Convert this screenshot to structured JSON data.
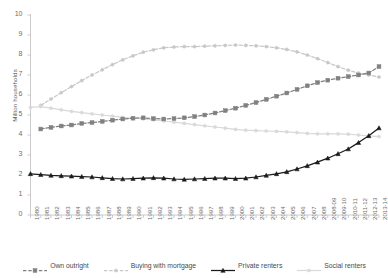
{
  "chart_data": {
    "type": "line",
    "title": "",
    "xlabel": "",
    "ylabel": "Million households",
    "ylim": [
      0,
      10
    ],
    "yticks": [
      0,
      1,
      2,
      3,
      4,
      5,
      6,
      7,
      8,
      9,
      10
    ],
    "grid": false,
    "legend_position": "bottom",
    "categories": [
      "1980",
      "1981",
      "1982",
      "1983",
      "1984",
      "1985",
      "1986",
      "1987",
      "1988",
      "1989",
      "1990",
      "1991",
      "1992",
      "1993",
      "1994",
      "1995",
      "1996",
      "1997",
      "1998",
      "1999",
      "2000",
      "2001",
      "2002",
      "2003",
      "2004",
      "2005",
      "2006",
      "2007",
      "2008",
      "2008-09",
      "2009-10",
      "2010-11",
      "2011-12",
      "2012-13",
      "2013-14"
    ],
    "series": [
      {
        "name": "Own outright",
        "color": "#808080",
        "marker": "square",
        "dash": "dashed",
        "values": [
          null,
          4.3,
          4.38,
          4.45,
          4.5,
          4.58,
          4.62,
          4.68,
          4.74,
          4.8,
          4.84,
          4.86,
          4.82,
          4.8,
          4.82,
          4.86,
          4.92,
          5.0,
          5.1,
          5.22,
          5.34,
          5.48,
          5.62,
          5.78,
          5.94,
          6.1,
          6.28,
          6.46,
          6.62,
          6.74,
          6.84,
          6.92,
          7.0,
          7.1,
          7.42
        ]
      },
      {
        "name": "Buying with mortgage",
        "color": "#c8c8c8",
        "marker": "circle",
        "dash": "dashed",
        "values": [
          null,
          5.48,
          5.8,
          6.12,
          6.42,
          6.72,
          7.0,
          7.26,
          7.52,
          7.76,
          7.96,
          8.14,
          8.26,
          8.36,
          8.4,
          8.42,
          8.42,
          8.44,
          8.46,
          8.48,
          8.5,
          8.48,
          8.46,
          8.42,
          8.36,
          8.28,
          8.16,
          8.0,
          7.82,
          7.62,
          7.42,
          7.24,
          7.1,
          7.0,
          6.9
        ]
      },
      {
        "name": "Private renters",
        "color": "#1a1a1a",
        "marker": "triangle",
        "dash": "solid",
        "values": [
          2.06,
          2.02,
          1.98,
          1.96,
          1.94,
          1.92,
          1.9,
          1.86,
          1.82,
          1.8,
          1.82,
          1.84,
          1.86,
          1.84,
          1.8,
          1.78,
          1.8,
          1.82,
          1.84,
          1.84,
          1.82,
          1.84,
          1.9,
          1.98,
          2.06,
          2.16,
          2.3,
          2.46,
          2.64,
          2.84,
          3.06,
          3.3,
          3.62,
          3.96,
          4.35
        ]
      },
      {
        "name": "Social renters",
        "color": "#d9d9d9",
        "marker": "circle",
        "dash": "solid",
        "values": [
          5.38,
          5.42,
          5.34,
          5.26,
          5.18,
          5.12,
          5.06,
          5.0,
          4.94,
          4.88,
          4.84,
          4.8,
          4.76,
          4.7,
          4.64,
          4.58,
          4.52,
          4.46,
          4.4,
          4.34,
          4.28,
          4.24,
          4.22,
          4.2,
          4.18,
          4.16,
          4.12,
          4.08,
          4.06,
          4.06,
          4.06,
          4.04,
          4.0,
          3.96,
          3.92
        ]
      }
    ]
  },
  "legend": {
    "items": [
      {
        "label": "Own outright"
      },
      {
        "label": "Buying with mortgage"
      },
      {
        "label": "Private renters"
      },
      {
        "label": "Social renters"
      }
    ]
  }
}
